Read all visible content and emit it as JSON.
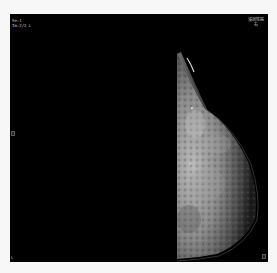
{
  "viewer": {
    "title": "Mammography Viewer",
    "background_color": "#000000",
    "frame_color": "#f7f7f7"
  },
  "overlay": {
    "top_left": {
      "line1": "Se:1",
      "line2": "Im:2/2 L"
    },
    "top_right": {
      "line1": "浸润性癌",
      "line2": "右"
    },
    "middle_left": "[P]",
    "middle_right": "",
    "bottom_left": "L",
    "bottom_right": "[P]"
  },
  "image": {
    "modality": "mammogram",
    "view_side": "right-half",
    "tissue_color": "#9a9a9a"
  }
}
